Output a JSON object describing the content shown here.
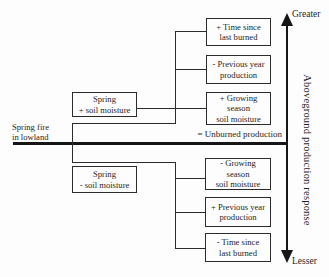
{
  "figure": {
    "root": {
      "label": "Spring fire\nin lowland"
    },
    "unburned_label": "= Unburned production",
    "upper": {
      "condition": "Spring\n+ soil moisture",
      "factors": [
        "+ Time since\nlast burned",
        "- Previous year\nproduction",
        "+ Growing\nseason\nsoil moisture"
      ]
    },
    "lower": {
      "condition": "Spring\n- soil moisture",
      "factors": [
        "- Growing\nseason\nsoil moisture",
        "+ Previous year\nproduction",
        "- Time since\nlast burned"
      ]
    },
    "axis": {
      "top": "Greater",
      "bottom": "Lesser",
      "label": "Aboveground production response"
    },
    "colors": {
      "ink": "#1f1f1f",
      "line": "#2b2b2b",
      "background": "#fdfdfd"
    }
  }
}
